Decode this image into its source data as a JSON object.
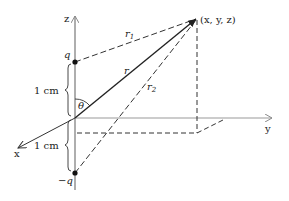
{
  "diagram": {
    "axes": {
      "z_label": "z",
      "y_label": "y",
      "x_label": "x"
    },
    "charges": {
      "positive_label": "q",
      "negative_label": "−q"
    },
    "distances": {
      "upper_spacing": "1 cm",
      "lower_spacing": "1 cm"
    },
    "point_label": "(x, y, z)",
    "vectors": {
      "r_label": "r",
      "r1_label": "r",
      "r1_sub": "1",
      "r2_label": "r",
      "r2_sub": "2"
    },
    "angle_label": "θ",
    "colors": {
      "axis": "#9a9a9a",
      "line": "#222222",
      "dashed": "#333333"
    }
  }
}
